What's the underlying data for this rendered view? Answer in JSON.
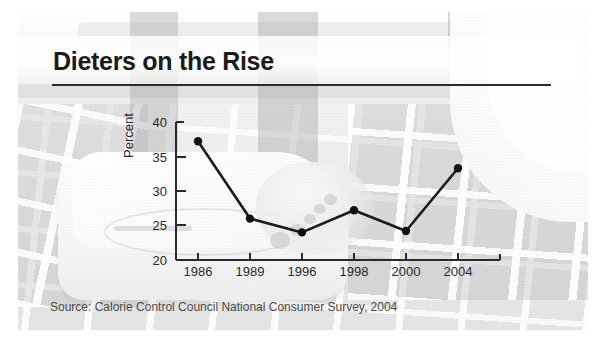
{
  "figure": {
    "title": "Dieters on the Rise",
    "source": "Source: Calorie Control Council National Consumer Survey, 2004",
    "background_description": "faded grayscale photograph of bare feet standing on a white bathroom scale on a tiled floor"
  },
  "chart_data": {
    "type": "line",
    "title": "Dieters on the Rise",
    "xlabel": "",
    "ylabel": "Percent",
    "categories": [
      "1986",
      "1989",
      "1996",
      "1998",
      "2000",
      "2004"
    ],
    "values": [
      37.2,
      26.0,
      24.0,
      27.2,
      24.2,
      33.3
    ],
    "series": [
      {
        "name": "Percent of dieters",
        "values": [
          37.2,
          26.0,
          24.0,
          27.2,
          24.2,
          33.3
        ]
      }
    ],
    "ylim": [
      20,
      40
    ],
    "yticks": [
      20,
      25,
      30,
      35,
      40
    ],
    "ytick_labels": [
      "20",
      "25",
      "30",
      "35",
      "40"
    ],
    "xtick_labels": [
      "1986",
      "1989",
      "1996",
      "1998",
      "2000",
      "2004"
    ],
    "grid": false,
    "legend": false,
    "legend_position": "none",
    "marker": "circle",
    "line_color": "#1a1a1a",
    "marker_color": "#111111",
    "axis_color": "#2a2a2a",
    "source_note": "Source: Calorie Control Council National Consumer Survey, 2004"
  },
  "colors": {
    "title_text": "#1b1b1b",
    "rule": "#2c2c2c",
    "tick_text": "#2a2a2a",
    "source_text": "#4a4a4a",
    "page_background": "#ffffff"
  }
}
